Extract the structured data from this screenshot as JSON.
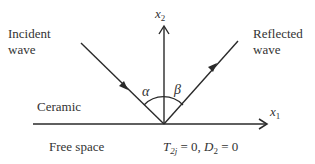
{
  "diagram": {
    "labels": {
      "incident_line1": "Incident",
      "incident_line2": "wave",
      "reflected_line1": "Reflected",
      "reflected_line2": "wave",
      "x2_axis": "x",
      "x2_sub": "2",
      "x1_axis": "x",
      "x1_sub": "1",
      "alpha": "α",
      "beta": "β",
      "upper_medium": "Ceramic",
      "lower_medium": "Free space",
      "bc_T": "T",
      "bc_T_sub": "2j",
      "bc_eq1": " = 0, ",
      "bc_D": "D",
      "bc_D_sub": "2",
      "bc_eq2": " = 0"
    },
    "colors": {
      "line": "#2a2a2a",
      "text": "#333333",
      "background": "#ffffff"
    }
  }
}
